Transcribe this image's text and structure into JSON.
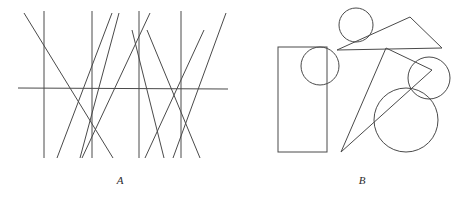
{
  "figure": {
    "canvas": {
      "width": 459,
      "height": 198
    },
    "stroke_color": "#4a4a4a",
    "label_color": "#2b2b2b",
    "background_color": "#ffffff"
  },
  "panels": [
    {
      "id": "A",
      "label": "A",
      "label_position": {
        "x": 120,
        "y": 184
      },
      "kind": "line-arrangement",
      "description": "Zigzag diagonal lines crossing four vertical lines and one horizontal line",
      "lines": {
        "horizontal": [
          {
            "name": "horizontal-baseline",
            "x1": 18,
            "y1": 88,
            "x2": 228,
            "y2": 89
          }
        ],
        "vertical": [
          {
            "name": "vertical-1",
            "x1": 44,
            "y1": 11,
            "x2": 44,
            "y2": 158
          },
          {
            "name": "vertical-2",
            "x1": 92,
            "y1": 11,
            "x2": 92,
            "y2": 158
          },
          {
            "name": "vertical-3",
            "x1": 139,
            "y1": 11,
            "x2": 139,
            "y2": 158
          },
          {
            "name": "vertical-4",
            "x1": 181,
            "y1": 11,
            "x2": 181,
            "y2": 158
          }
        ],
        "diagonal": [
          {
            "name": "diagonal-1",
            "x1": 24,
            "y1": 13,
            "x2": 113,
            "y2": 158
          },
          {
            "name": "diagonal-2",
            "x1": 112,
            "y1": 13,
            "x2": 57,
            "y2": 158
          },
          {
            "name": "diagonal-3",
            "x1": 119,
            "y1": 13,
            "x2": 80,
            "y2": 158
          },
          {
            "name": "diagonal-4",
            "x1": 82,
            "y1": 158,
            "x2": 150,
            "y2": 13
          },
          {
            "name": "diagonal-5",
            "x1": 164,
            "y1": 158,
            "x2": 132,
            "y2": 30
          },
          {
            "name": "diagonal-6",
            "x1": 147,
            "y1": 30,
            "x2": 200,
            "y2": 158
          },
          {
            "name": "diagonal-7",
            "x1": 173,
            "y1": 158,
            "x2": 226,
            "y2": 13
          },
          {
            "name": "diagonal-8",
            "x1": 145,
            "y1": 158,
            "x2": 204,
            "y2": 30
          }
        ]
      }
    },
    {
      "id": "B",
      "label": "B",
      "label_position": {
        "x": 362,
        "y": 184
      },
      "kind": "shape-arrangement",
      "description": "Rectangle, triangle, thin sliver triangle and four overlapping circles",
      "shapes": {
        "rectangles": [
          {
            "name": "tall-rectangle",
            "x": 278,
            "y": 47,
            "width": 49,
            "height": 105
          }
        ],
        "circles": [
          {
            "name": "top-circle",
            "cx": 356,
            "cy": 25,
            "r": 17
          },
          {
            "name": "rectangle-overlap-circle",
            "cx": 320,
            "cy": 66,
            "r": 19
          },
          {
            "name": "right-medium-circle",
            "cx": 429,
            "cy": 78,
            "r": 21
          },
          {
            "name": "large-bottom-circle",
            "cx": 406,
            "cy": 120,
            "r": 32
          }
        ],
        "triangles": [
          {
            "name": "wide-triangle",
            "points": "337,50 410,17 442,48"
          },
          {
            "name": "sliver-triangle",
            "points": "386,48 341,152 432,70"
          }
        ]
      }
    }
  ]
}
